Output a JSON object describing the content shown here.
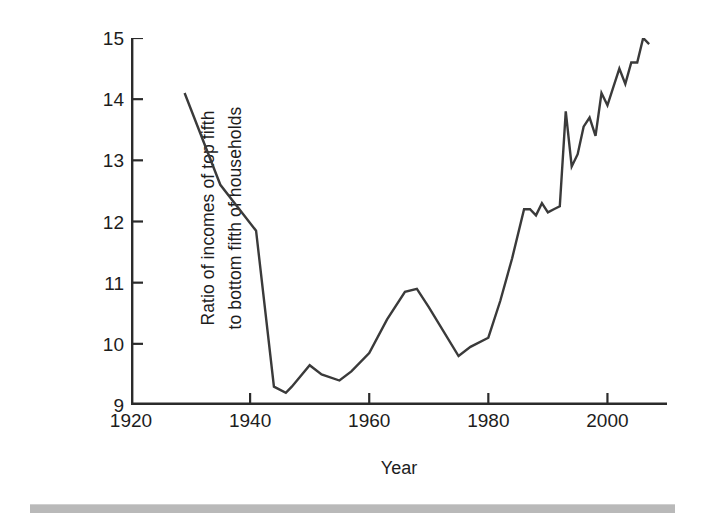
{
  "figure": {
    "background_color": "#ffffff",
    "line_color": "#3a3a3a",
    "axis_color": "#2b2b2b",
    "footer_rule_color": "#b9b9b9"
  },
  "axis_titles": {
    "y_line_1": "Ratio of incomes of top fifth",
    "y_line_2": "to bottom fifth of households",
    "x": "Year"
  },
  "ticks": {
    "y": [
      "15",
      "14",
      "13",
      "12",
      "11",
      "10",
      "9"
    ],
    "x": [
      "1920",
      "1940",
      "1960",
      "1980",
      "2000"
    ]
  },
  "chart_data": {
    "type": "line",
    "title": "",
    "subtitle": "",
    "xlabel": "Year",
    "ylabel": "Ratio of incomes of top fifth to bottom fifth of households",
    "xlim": [
      1920,
      2010
    ],
    "ylim": [
      9,
      15
    ],
    "xticks": [
      1920,
      1940,
      1960,
      1980,
      2000
    ],
    "yticks": [
      9,
      10,
      11,
      12,
      13,
      14,
      15
    ],
    "grid": false,
    "legend": false,
    "legend_position": "none",
    "annotations": [],
    "series": [
      {
        "name": "Ratio of incomes of top fifth to bottom fifth of households",
        "color": "#3a3a3a",
        "x": [
          1929,
          1935,
          1941,
          1944,
          1946,
          1947,
          1950,
          1952,
          1955,
          1957,
          1960,
          1963,
          1966,
          1968,
          1970,
          1975,
          1977,
          1980,
          1982,
          1984,
          1986,
          1987,
          1988,
          1989,
          1990,
          1991,
          1992,
          1993,
          1994,
          1995,
          1996,
          1997,
          1998,
          1999,
          2000,
          2001,
          2002,
          2003,
          2004,
          2005,
          2006,
          2007
        ],
        "y": [
          14.1,
          12.6,
          11.85,
          9.3,
          9.2,
          9.3,
          9.65,
          9.5,
          9.4,
          9.55,
          9.85,
          10.4,
          10.85,
          10.9,
          10.6,
          9.8,
          9.95,
          10.1,
          10.7,
          11.4,
          12.2,
          12.2,
          12.1,
          12.3,
          12.15,
          12.2,
          12.25,
          13.8,
          12.9,
          13.1,
          13.55,
          13.7,
          13.4,
          14.1,
          13.9,
          14.2,
          14.5,
          14.25,
          14.6,
          14.6,
          15.0,
          14.9
        ]
      }
    ]
  }
}
